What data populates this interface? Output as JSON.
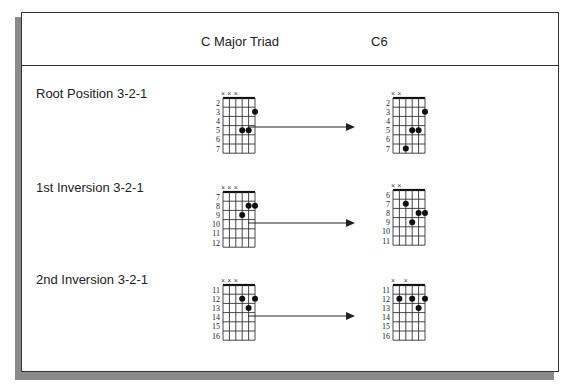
{
  "header": {
    "col1": "C Major Triad",
    "col2": "C6"
  },
  "rows": [
    {
      "label": "Root Position 3-2-1",
      "triad": {
        "start_fret": 2,
        "frets": [
          2,
          3,
          4,
          5,
          6,
          7
        ],
        "muted": [
          1,
          2,
          3
        ],
        "dots": [
          [
            6,
            3
          ],
          [
            4,
            5
          ],
          [
            5,
            5
          ]
        ]
      },
      "c6": {
        "start_fret": 2,
        "frets": [
          2,
          3,
          4,
          5,
          6,
          7
        ],
        "muted": [
          1,
          2
        ],
        "dots": [
          [
            6,
            3
          ],
          [
            4,
            5
          ],
          [
            5,
            5
          ],
          [
            3,
            7
          ]
        ]
      }
    },
    {
      "label": "1st Inversion 3-2-1",
      "triad": {
        "start_fret": 7,
        "frets": [
          7,
          8,
          9,
          10,
          11,
          12
        ],
        "muted": [
          1,
          2,
          3
        ],
        "dots": [
          [
            5,
            8
          ],
          [
            6,
            8
          ],
          [
            4,
            9
          ]
        ]
      },
      "c6": {
        "start_fret": 6,
        "frets": [
          6,
          7,
          8,
          9,
          10,
          11
        ],
        "muted": [
          1,
          2
        ],
        "dots": [
          [
            3,
            7
          ],
          [
            5,
            8
          ],
          [
            6,
            8
          ],
          [
            4,
            9
          ]
        ]
      }
    },
    {
      "label": "2nd Inversion 3-2-1",
      "triad": {
        "start_fret": 11,
        "frets": [
          11,
          12,
          13,
          14,
          15,
          16
        ],
        "muted": [
          1,
          2,
          3
        ],
        "dots": [
          [
            4,
            12
          ],
          [
            6,
            12
          ],
          [
            5,
            13
          ]
        ]
      },
      "c6": {
        "start_fret": 11,
        "frets": [
          11,
          12,
          13,
          14,
          15,
          16
        ],
        "muted": [
          1,
          3
        ],
        "dots": [
          [
            2,
            12
          ],
          [
            4,
            12
          ],
          [
            6,
            12
          ],
          [
            5,
            13
          ]
        ]
      }
    }
  ],
  "icons": {
    "muted": "×",
    "arrow": "arrow-right"
  }
}
